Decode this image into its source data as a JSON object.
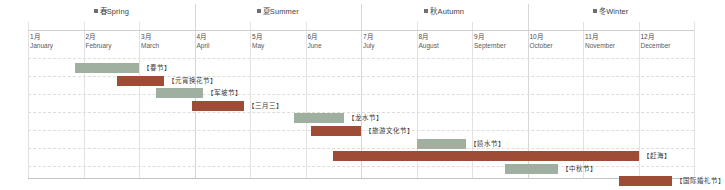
{
  "chart_data": {
    "type": "bar",
    "title": "",
    "xlabel": "",
    "ylabel": "",
    "orientation": "horizontal-gantt",
    "grid": true,
    "legend_position": "none",
    "x_axis": {
      "unit": "month",
      "min": 1,
      "max": 13,
      "tick_count": 12
    },
    "categories": [
      "春节",
      "元宵换花节",
      "军坡节",
      "三月三",
      "龙水节",
      "旅游文化节",
      "嬉水节",
      "赶海",
      "中秋节",
      "国际婚礼节"
    ],
    "series": [
      {
        "name": "节庆时段",
        "values": [
          {
            "label": "【春节】",
            "start_month": 1.85,
            "end_month": 3.0,
            "color": "green"
          },
          {
            "label": "【元宵换花节】",
            "start_month": 2.6,
            "end_month": 3.45,
            "color": "red"
          },
          {
            "label": "【军坡节】",
            "start_month": 3.3,
            "end_month": 4.15,
            "color": "green"
          },
          {
            "label": "【三月三】",
            "start_month": 3.95,
            "end_month": 4.9,
            "color": "red"
          },
          {
            "label": "【龙水节】",
            "start_month": 5.8,
            "end_month": 6.7,
            "color": "green"
          },
          {
            "label": "【旅游文化节】",
            "start_month": 6.1,
            "end_month": 7.0,
            "color": "red"
          },
          {
            "label": "【嬉水节】",
            "start_month": 8.0,
            "end_month": 8.9,
            "color": "green"
          },
          {
            "label": "【赶海】",
            "start_month": 6.5,
            "end_month": 12.0,
            "color": "red"
          },
          {
            "label": "【中秋节】",
            "start_month": 9.6,
            "end_month": 10.55,
            "color": "green"
          },
          {
            "label": "【国际婚礼节】",
            "start_month": 11.65,
            "end_month": 12.6,
            "color": "red"
          }
        ]
      }
    ],
    "colors": {
      "green": "#9fb0a1",
      "red": "#9e4c36",
      "gridline": "#e0dcd8",
      "axis": "#c4c4c4",
      "text": "#3a3a3a"
    }
  },
  "seasons": [
    {
      "cn": "春",
      "en": "Spring",
      "start_month": 1,
      "span": 3
    },
    {
      "cn": "夏",
      "en": "Summer",
      "start_month": 4,
      "span": 3
    },
    {
      "cn": "秋",
      "en": "Autumn",
      "start_month": 7,
      "span": 3
    },
    {
      "cn": "冬",
      "en": "Winter",
      "start_month": 10,
      "span": 3
    }
  ],
  "months": [
    {
      "cn": "1月",
      "en": "January"
    },
    {
      "cn": "2月",
      "en": "February"
    },
    {
      "cn": "3月",
      "en": "March"
    },
    {
      "cn": "4月",
      "en": "April"
    },
    {
      "cn": "5月",
      "en": "May"
    },
    {
      "cn": "6月",
      "en": "June"
    },
    {
      "cn": "7月",
      "en": "July"
    },
    {
      "cn": "8月",
      "en": "August"
    },
    {
      "cn": "9月",
      "en": "September"
    },
    {
      "cn": "10月",
      "en": "October"
    },
    {
      "cn": "11月",
      "en": "November"
    },
    {
      "cn": "12月",
      "en": "December"
    }
  ]
}
